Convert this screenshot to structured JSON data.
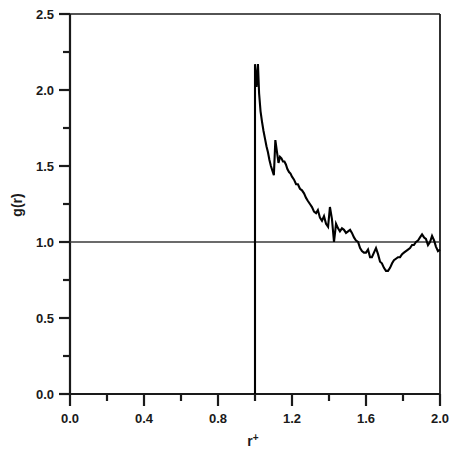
{
  "figure": {
    "width": 460,
    "height": 455,
    "background": "#ffffff",
    "line_color": "#000000",
    "axis_color": "#1a1a1a"
  },
  "axes": {
    "x_title": "r",
    "x_title_superscript": "+",
    "y_title": "g(r)",
    "x_tick_labels": [
      "0.0",
      "0.4",
      "0.8",
      "1.2",
      "1.6",
      "2.0"
    ],
    "y_tick_labels": [
      "0.0",
      "0.5",
      "1.0",
      "1.5",
      "2.0",
      "2.5"
    ]
  },
  "chart_data": {
    "type": "line",
    "title": "",
    "xlabel": "r+",
    "ylabel": "g(r)",
    "xlim": [
      0.0,
      2.0
    ],
    "ylim": [
      0.0,
      2.5
    ],
    "xticks": [
      0.0,
      0.4,
      0.8,
      1.2,
      1.6,
      2.0
    ],
    "yticks": [
      0.0,
      0.5,
      1.0,
      1.5,
      2.0,
      2.5
    ],
    "xminorticks": [
      0.2,
      0.6,
      1.0,
      1.4,
      1.8
    ],
    "yminorticks": [
      0.25,
      0.75,
      1.25,
      1.75,
      2.25
    ],
    "grid": false,
    "legend": null,
    "reference_lines": [
      {
        "orientation": "horizontal",
        "value": 1.0,
        "color": "#3a3a3a"
      }
    ],
    "series": [
      {
        "name": "g(r)",
        "color": "#000000",
        "x": [
          1.0,
          1.0,
          1.008,
          1.016,
          1.022,
          1.03,
          1.038,
          1.046,
          1.054,
          1.062,
          1.07,
          1.078,
          1.086,
          1.094,
          1.102,
          1.11,
          1.118,
          1.127,
          1.135,
          1.143,
          1.151,
          1.159,
          1.167,
          1.175,
          1.184,
          1.192,
          1.2,
          1.211,
          1.222,
          1.232,
          1.243,
          1.254,
          1.265,
          1.276,
          1.286,
          1.297,
          1.308,
          1.319,
          1.33,
          1.34,
          1.351,
          1.362,
          1.373,
          1.384,
          1.395,
          1.405,
          1.416,
          1.427,
          1.438,
          1.449,
          1.459,
          1.47,
          1.481,
          1.492,
          1.503,
          1.514,
          1.524,
          1.535,
          1.546,
          1.557,
          1.568,
          1.578,
          1.589,
          1.6,
          1.611,
          1.622,
          1.632,
          1.643,
          1.654,
          1.665,
          1.676,
          1.686,
          1.697,
          1.708,
          1.719,
          1.73,
          1.741,
          1.751,
          1.762,
          1.773,
          1.784,
          1.795,
          1.805,
          1.816,
          1.827,
          1.838,
          1.849,
          1.859,
          1.87,
          1.881,
          1.892,
          1.903,
          1.914,
          1.924,
          1.935,
          1.946,
          1.957,
          1.968,
          1.978,
          1.989,
          2.0
        ],
        "y": [
          0.0,
          2.17,
          2.02,
          2.17,
          1.98,
          1.86,
          1.79,
          1.73,
          1.68,
          1.63,
          1.59,
          1.54,
          1.5,
          1.47,
          1.44,
          1.67,
          1.6,
          1.52,
          1.56,
          1.55,
          1.53,
          1.53,
          1.51,
          1.48,
          1.46,
          1.45,
          1.43,
          1.41,
          1.38,
          1.38,
          1.35,
          1.34,
          1.32,
          1.29,
          1.27,
          1.25,
          1.23,
          1.2,
          1.19,
          1.21,
          1.16,
          1.14,
          1.17,
          1.12,
          1.1,
          1.23,
          1.15,
          1.0,
          1.12,
          1.09,
          1.07,
          1.09,
          1.08,
          1.06,
          1.07,
          1.08,
          1.06,
          1.03,
          1.01,
          1.0,
          0.96,
          0.94,
          0.93,
          0.93,
          0.95,
          0.9,
          0.9,
          0.93,
          0.96,
          0.92,
          0.87,
          0.86,
          0.83,
          0.81,
          0.81,
          0.83,
          0.86,
          0.88,
          0.89,
          0.9,
          0.9,
          0.92,
          0.93,
          0.94,
          0.95,
          0.96,
          0.98,
          0.98,
          1.0,
          1.01,
          1.03,
          1.05,
          1.03,
          1.02,
          0.98,
          1.0,
          1.04,
          1.01,
          0.97,
          0.94,
          0.95
        ]
      }
    ]
  }
}
